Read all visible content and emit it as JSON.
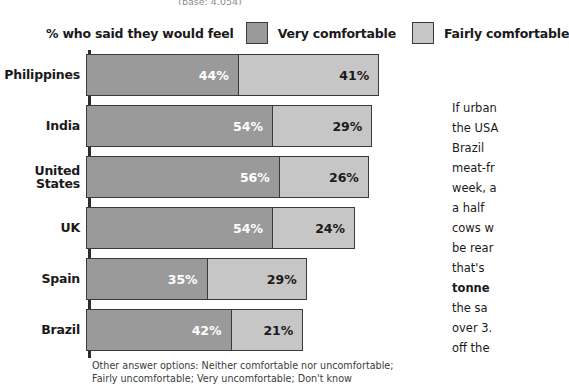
{
  "base_note": "(base: 4,054)",
  "legend": {
    "lead_text": "% who said they would feel",
    "series": [
      {
        "label": "Very comfortable",
        "color": "#9a9a9a",
        "swatch": "very-comfortable-swatch"
      },
      {
        "label": "Fairly comfortable",
        "color": "#c6c6c6",
        "swatch": "fairly-comfortable-swatch"
      }
    ]
  },
  "footnote": {
    "line1": "Other answer options: Neither comfortable nor uncomfortable;",
    "line2": "Fairly uncomfortable; Very uncomfortable; Don't know"
  },
  "side_text": {
    "lines": [
      {
        "text": "If urban",
        "bold": false
      },
      {
        "text": "the USA",
        "bold": false
      },
      {
        "text": "Brazil",
        "bold": false
      },
      {
        "text": "meat-fr",
        "bold": false
      },
      {
        "text": "week, a",
        "bold": false
      },
      {
        "text": "a half",
        "bold": false
      },
      {
        "text": "cows w",
        "bold": false
      },
      {
        "text": "be rear",
        "bold": false
      },
      {
        "text": "that's",
        "bold": false
      },
      {
        "text": "tonne",
        "bold": true
      },
      {
        "text": "the sa",
        "bold": false
      },
      {
        "text": "over 3.",
        "bold": false
      },
      {
        "text": "off the",
        "bold": false
      }
    ]
  },
  "chart_data": {
    "type": "bar",
    "orientation": "horizontal",
    "stacked": true,
    "title": "",
    "subtitle": "(base: 4,054)",
    "xlabel": "",
    "ylabel": "",
    "xlim": [
      0,
      100
    ],
    "grid": false,
    "legend_position": "top",
    "categories": [
      "Philippines",
      "India",
      "United States",
      "UK",
      "Spain",
      "Brazil"
    ],
    "series": [
      {
        "name": "Very comfortable",
        "color": "#9a9a9a",
        "values": [
          44,
          54,
          56,
          54,
          35,
          42
        ]
      },
      {
        "name": "Fairly comfortable",
        "color": "#c6c6c6",
        "values": [
          41,
          29,
          26,
          24,
          29,
          21
        ]
      }
    ],
    "totals": [
      85,
      83,
      82,
      78,
      64,
      63
    ],
    "value_suffix": "%",
    "rows": [
      {
        "category": "Philippines",
        "very": 44,
        "fairly": 41,
        "very_label": "44%",
        "fairly_label": "41%",
        "total": 85
      },
      {
        "category": "India",
        "very": 54,
        "fairly": 29,
        "very_label": "54%",
        "fairly_label": "29%",
        "total": 83
      },
      {
        "category": "United States",
        "very": 56,
        "fairly": 26,
        "very_label": "56%",
        "fairly_label": "26%",
        "total": 82
      },
      {
        "category": "UK",
        "very": 54,
        "fairly": 24,
        "very_label": "54%",
        "fairly_label": "24%",
        "total": 78
      },
      {
        "category": "Spain",
        "very": 35,
        "fairly": 29,
        "very_label": "35%",
        "fairly_label": "29%",
        "total": 64
      },
      {
        "category": "Brazil",
        "very": 42,
        "fairly": 21,
        "very_label": "42%",
        "fairly_label": "21%",
        "total": 63
      }
    ]
  }
}
